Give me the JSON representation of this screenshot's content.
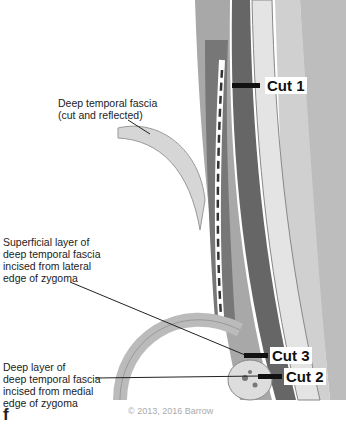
{
  "labels": {
    "deep_temporal_fascia": [
      "Deep temporal fascia",
      "(cut and reflected)"
    ],
    "superficial_layer": [
      "Superficial layer of",
      "deep temporal fascia",
      "incised from lateral",
      "edge of zygoma"
    ],
    "deep_layer": [
      "Deep layer of",
      "deep temporal fascia",
      "incised from medial",
      "edge of zygoma"
    ]
  },
  "cuts": {
    "cut1": "Cut 1",
    "cut2": "Cut 2",
    "cut3": "Cut 3"
  },
  "panel_letter": "f",
  "copyright": "© 2013, 2016 Barrow",
  "colors": {
    "dark_tissue": "#555555",
    "mid_tissue": "#9a9a9a",
    "light_tissue": "#d8d8d8",
    "bone": "#c8c8c8"
  }
}
